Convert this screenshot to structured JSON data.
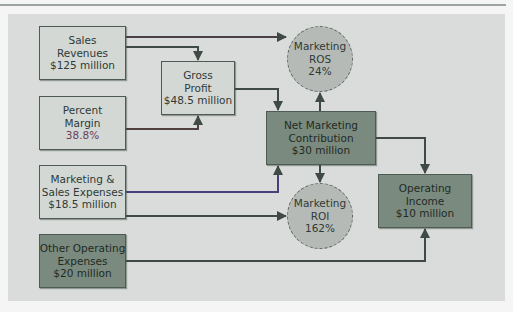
{
  "diagram": {
    "type": "flow",
    "title": "",
    "nodes": {
      "sales_revenues": {
        "lines": [
          "Sales",
          "Revenues",
          "$125 million"
        ],
        "style": "light"
      },
      "percent_margin": {
        "lines": [
          "Percent",
          "Margin",
          "38.8%"
        ],
        "style": "light"
      },
      "gross_profit": {
        "lines": [
          "Gross",
          "Profit",
          "$48.5 million"
        ],
        "style": "light"
      },
      "marketing_sales_expenses": {
        "lines": [
          "Marketing &",
          "Sales Expenses",
          "$18.5 million"
        ],
        "style": "light"
      },
      "other_operating_expenses": {
        "lines": [
          "Other Operating",
          "Expenses",
          "$20 million"
        ],
        "style": "dark"
      },
      "net_marketing_contribution": {
        "lines": [
          "Net Marketing",
          "Contribution",
          "$30 million"
        ],
        "style": "dark"
      },
      "marketing_ros": {
        "lines": [
          "Marketing",
          "ROS",
          "24%"
        ],
        "style": "circle"
      },
      "marketing_roi": {
        "lines": [
          "Marketing",
          "ROI",
          "162%"
        ],
        "style": "circle"
      },
      "operating_income": {
        "lines": [
          "Operating",
          "Income",
          "$10 million"
        ],
        "style": "dark"
      }
    },
    "edges": [
      {
        "from": "Sales Revenues",
        "to": "Marketing ROS"
      },
      {
        "from": "Sales Revenues",
        "to": "Gross Profit"
      },
      {
        "from": "Percent Margin",
        "to": "Gross Profit"
      },
      {
        "from": "Gross Profit",
        "to": "Net Marketing Contribution"
      },
      {
        "from": "Marketing & Sales Expenses",
        "to": "Net Marketing Contribution"
      },
      {
        "from": "Marketing & Sales Expenses",
        "to": "Marketing ROI"
      },
      {
        "from": "Net Marketing Contribution",
        "to": "Marketing ROS"
      },
      {
        "from": "Net Marketing Contribution",
        "to": "Marketing ROI"
      },
      {
        "from": "Net Marketing Contribution",
        "to": "Operating Income"
      },
      {
        "from": "Other Operating Expenses",
        "to": "Operating Income"
      }
    ],
    "colors": {
      "panel": "#d9dcda",
      "light_box": "#d3d8d5",
      "dark_box": "#7a8a7f",
      "circle": "#b5bab7",
      "wire": "#3f4a44",
      "wire_purple": "#4b3f7a",
      "wire_brown": "#5a3a3a"
    }
  }
}
